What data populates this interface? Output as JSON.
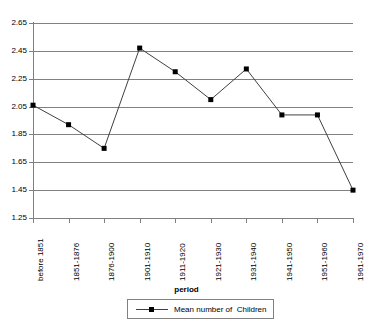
{
  "chart_data": {
    "type": "line",
    "title": "",
    "xlabel": "period",
    "ylabel": "",
    "categories": [
      "before 1851",
      "1851-1876",
      "1876-1900",
      "1901-1910",
      "1911-1920",
      "1921-1930",
      "1931-1940",
      "1941-1950",
      "1951-1960",
      "1961-1970"
    ],
    "series": [
      {
        "name": "Mean number of  Children",
        "values": [
          2.06,
          1.92,
          1.75,
          2.47,
          2.3,
          2.1,
          2.32,
          1.99,
          1.99,
          1.45
        ]
      }
    ],
    "ylim": [
      1.25,
      2.65
    ],
    "ytick_labels": [
      "2.65",
      "2.45",
      "2.25",
      "2.05",
      "1.85",
      "1.65",
      "1.45",
      "1.25"
    ],
    "ytick_values": [
      2.65,
      2.45,
      2.25,
      2.05,
      1.85,
      1.65,
      1.45,
      1.25
    ],
    "grid": "horizontal",
    "legend_position": "bottom",
    "colors": {
      "line": "#404040",
      "marker": "#000000",
      "grid": "#808080",
      "axis": "#808080",
      "background": "#ffffff",
      "text": "#000000"
    }
  },
  "legend": {
    "entries": [
      {
        "label": "Mean number of  Children",
        "marker": "square-marker"
      }
    ]
  },
  "axis": {
    "x_title": "period"
  }
}
